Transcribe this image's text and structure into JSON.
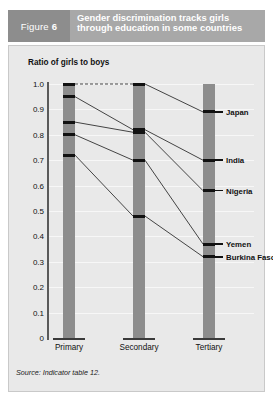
{
  "header": {
    "figure_prefix": "Figure",
    "figure_number": "6",
    "title": "Gender discrimination tracks girls through education in some countries",
    "badge_color": "#8d8d8d",
    "title_bar_color": "#a8a8a8"
  },
  "source": {
    "label": "Source:",
    "text": "Indicator table 12."
  },
  "chart_data": {
    "type": "line",
    "title": "Gender discrimination tracks girls through education in some countries",
    "xlabel": "",
    "ylabel": "Ratio of girls to boys",
    "categories": [
      "Primary",
      "Secondary",
      "Tertiary"
    ],
    "ylim": [
      0,
      1.0
    ],
    "ytick_labels": [
      "1.0",
      "0.9",
      "0.8",
      "0.7",
      "0.6",
      "0.5",
      "0.4",
      "0.3",
      "0.2",
      "0.1",
      "0"
    ],
    "ytick_values": [
      1.0,
      0.9,
      0.8,
      0.7,
      0.6,
      0.5,
      0.4,
      0.3,
      0.2,
      0.1,
      0
    ],
    "grid": true,
    "legend": "right-inline-labels",
    "bar_color": "#8d8d8d",
    "marker_color": "#111111",
    "series": [
      {
        "name": "Japan",
        "values": [
          1.0,
          1.0,
          0.89
        ]
      },
      {
        "name": "India",
        "values": [
          0.95,
          0.82,
          0.7
        ]
      },
      {
        "name": "Nigeria",
        "values": [
          0.85,
          0.81,
          0.58
        ]
      },
      {
        "name": "Yemen",
        "values": [
          0.8,
          0.7,
          0.37
        ]
      },
      {
        "name": "Burkina Faso",
        "values": [
          0.72,
          0.48,
          0.32
        ]
      }
    ]
  }
}
